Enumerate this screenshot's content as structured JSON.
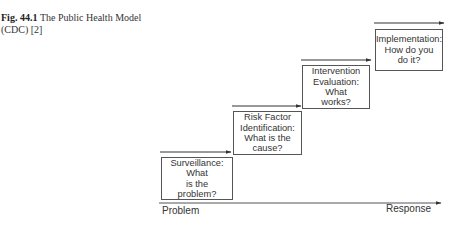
{
  "caption": {
    "fig_label": "Fig. 44.1",
    "text": "The Public Health Model (CDC) [2]"
  },
  "diagram": {
    "steps": [
      {
        "id": "surveillance",
        "label": "Surveillance:\nWhat\nis the\nproblem?"
      },
      {
        "id": "risk-factor",
        "label": "Risk Factor\nIdentification:\nWhat is the\ncause?"
      },
      {
        "id": "intervention",
        "label": "Intervention\nEvaluation:\nWhat\nworks?"
      },
      {
        "id": "implementation",
        "label": "Implementation:\nHow do you\ndo it?"
      }
    ],
    "axis": {
      "start_label": "Problem",
      "end_label": "Response"
    }
  }
}
